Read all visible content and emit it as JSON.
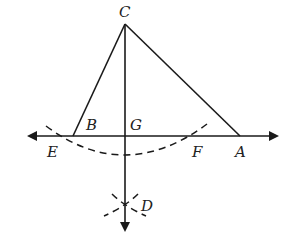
{
  "diagram": {
    "type": "geometric-construction",
    "points": {
      "C": {
        "label": "C",
        "x": 125,
        "y": 24
      },
      "B": {
        "label": "B",
        "x": 73,
        "y": 136
      },
      "G": {
        "label": "G",
        "x": 125,
        "y": 136
      },
      "A": {
        "label": "A",
        "x": 240,
        "y": 136
      },
      "E": {
        "label": "E",
        "x": 60,
        "y": 136
      },
      "F": {
        "label": "F",
        "x": 195,
        "y": 136
      },
      "D": {
        "label": "D",
        "x": 125,
        "y": 206
      }
    },
    "segments": [
      "CB",
      "CA",
      "BA"
    ],
    "lines": [
      "line EA (double arrow)",
      "ray CD (arrow down)"
    ],
    "arcs": [
      "arc centered C through E and F",
      "arcs intersecting at D"
    ],
    "stroke_color": "#1a1a1a"
  }
}
